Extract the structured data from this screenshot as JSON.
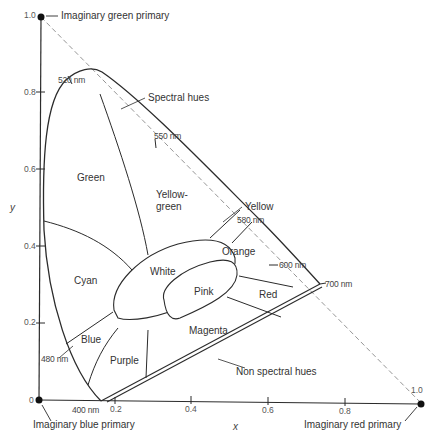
{
  "figure": {
    "axes": {
      "x_label": "x",
      "y_label": "y",
      "x_ticks": [
        "0.2",
        "0.4",
        "0.6",
        "0.8",
        "1.0"
      ],
      "y_ticks": [
        "0",
        "0.2",
        "0.4",
        "0.6",
        "0.8",
        "1.0"
      ]
    },
    "primaries": {
      "green": "Imaginary green primary",
      "blue": "Imaginary blue primary",
      "red": "Imaginary red primary"
    },
    "wavelengths": {
      "w400": "400 nm",
      "w480": "480 nm",
      "w520": "520 nm",
      "w550": "550 nm",
      "w580": "580 nm",
      "w600": "600 nm",
      "w700": "700 nm"
    },
    "callouts": {
      "spectral": "Spectral hues",
      "nonspectral": "Non spectral hues",
      "yellow": "Yellow"
    },
    "regions": {
      "green": "Green",
      "yellow_green_1": "Yellow-",
      "yellow_green_2": "green",
      "cyan": "Cyan",
      "white": "White",
      "orange": "Orange",
      "pink": "Pink",
      "red": "Red",
      "blue": "Blue",
      "purple": "Purple",
      "magenta": "Magenta"
    },
    "colors": {
      "line": "#2b2b2b",
      "dashed": "#8a8a8a",
      "background": "#ffffff"
    }
  }
}
